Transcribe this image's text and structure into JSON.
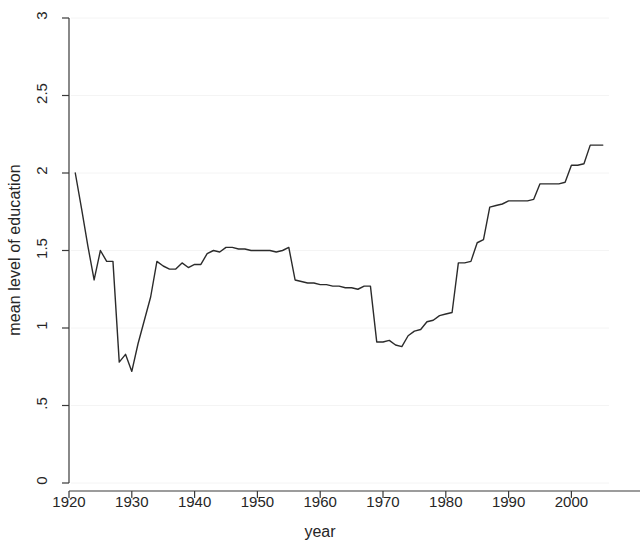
{
  "chart_data": {
    "type": "line",
    "title": "",
    "xlabel": "year",
    "ylabel": "mean level of education",
    "xlim": [
      1920,
      2006
    ],
    "ylim": [
      0,
      3
    ],
    "grid": true,
    "legend": null,
    "xticks": [
      1920,
      1930,
      1940,
      1950,
      1960,
      1970,
      1980,
      1990,
      2000
    ],
    "xtick_labels": [
      "1920",
      "1930",
      "1940",
      "1950",
      "1960",
      "1970",
      "1980",
      "1990",
      "2000"
    ],
    "yticks": [
      0,
      0.5,
      1,
      1.5,
      2,
      2.5,
      3
    ],
    "ytick_labels": [
      "0",
      ".5",
      "1",
      "1.5",
      "2",
      "2.5",
      "3"
    ],
    "series": [
      {
        "name": "mean level of education",
        "color": "#2b2b2b",
        "x": [
          1921,
          1922,
          1923,
          1924,
          1925,
          1926,
          1927,
          1928,
          1929,
          1930,
          1931,
          1932,
          1933,
          1934,
          1935,
          1936,
          1937,
          1938,
          1939,
          1940,
          1941,
          1942,
          1943,
          1944,
          1945,
          1946,
          1947,
          1948,
          1949,
          1950,
          1951,
          1952,
          1953,
          1954,
          1955,
          1956,
          1957,
          1958,
          1959,
          1960,
          1961,
          1962,
          1963,
          1964,
          1965,
          1966,
          1967,
          1968,
          1969,
          1970,
          1971,
          1972,
          1973,
          1974,
          1975,
          1976,
          1977,
          1978,
          1979,
          1980,
          1981,
          1982,
          1983,
          1984,
          1985,
          1986,
          1987,
          1988,
          1989,
          1990,
          1991,
          1992,
          1993,
          1994,
          1995,
          1996,
          1997,
          1998,
          1999,
          2000,
          2001,
          2002,
          2003,
          2004,
          2005
        ],
        "y": [
          2.0,
          1.77,
          1.53,
          1.31,
          1.5,
          1.43,
          1.43,
          0.78,
          0.83,
          0.72,
          0.9,
          1.05,
          1.2,
          1.43,
          1.4,
          1.38,
          1.38,
          1.42,
          1.39,
          1.41,
          1.41,
          1.48,
          1.5,
          1.49,
          1.52,
          1.52,
          1.51,
          1.51,
          1.5,
          1.5,
          1.5,
          1.5,
          1.49,
          1.5,
          1.52,
          1.31,
          1.3,
          1.29,
          1.29,
          1.28,
          1.28,
          1.27,
          1.27,
          1.26,
          1.26,
          1.25,
          1.27,
          1.27,
          0.91,
          0.91,
          0.92,
          0.89,
          0.88,
          0.95,
          0.98,
          0.99,
          1.04,
          1.05,
          1.08,
          1.09,
          1.1,
          1.42,
          1.42,
          1.43,
          1.55,
          1.57,
          1.78,
          1.79,
          1.8,
          1.82,
          1.82,
          1.82,
          1.82,
          1.83,
          1.93,
          1.93,
          1.93,
          1.93,
          1.94,
          2.05,
          2.05,
          2.06,
          2.18,
          2.18,
          2.18
        ]
      }
    ]
  },
  "axes": {
    "y_title": "mean level of education",
    "x_title": "year"
  }
}
